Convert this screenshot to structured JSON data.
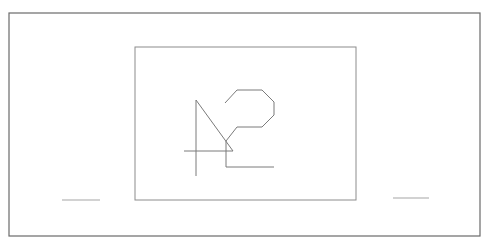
{
  "diagram": {
    "background": "#ffffff",
    "colors": {
      "outer_frame": "#6a6a6a",
      "inner_frame": "#8c8c8c",
      "sketch": "#7a7a7a",
      "side_marks": "#a5a5a5"
    },
    "outer_frame": {
      "x": 9,
      "y": 13,
      "width": 471,
      "height": 223
    },
    "inner_frame": {
      "x": 135,
      "y": 47,
      "width": 221,
      "height": 153
    },
    "side_marks": [
      {
        "x1": 62,
        "y1": 200,
        "x2": 100,
        "y2": 200
      },
      {
        "x1": 393,
        "y1": 198,
        "x2": 429,
        "y2": 198
      }
    ],
    "sketch": {
      "triangle_vertical": {
        "x1": 196,
        "y1": 100,
        "x2": 196,
        "y2": 176
      },
      "triangle_diagonal": {
        "x1": 196,
        "y1": 100,
        "x2": 233,
        "y2": 151
      },
      "triangle_base": {
        "x1": 184,
        "y1": 151,
        "x2": 233,
        "y2": 151
      },
      "hook_vertical": {
        "x1": 226,
        "y1": 141,
        "x2": 226,
        "y2": 167
      },
      "hook_base": {
        "x1": 226,
        "y1": 167,
        "x2": 274,
        "y2": 167
      },
      "curve_points": "225,103 237,90 262,90 274,102 274,115 262,127 237,127 226,141"
    }
  }
}
